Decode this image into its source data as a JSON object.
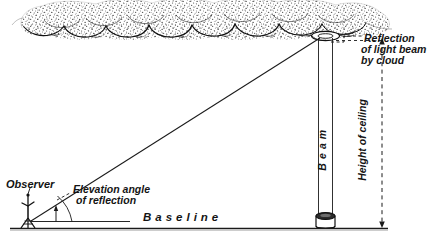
{
  "diagram": {
    "background_color": "#ffffff",
    "ink_color": "#1a1a1a",
    "cloud_fill": "#f2f2f2"
  },
  "labels": {
    "observer": "Observer",
    "elevation_angle_line1": "Elevation angle",
    "elevation_angle_line2": "of reflection",
    "base_line": "B a s e   l i n e",
    "beam": "B e a m",
    "height_of_ceiling": "Height of ceiling",
    "reflection_line1": "Reflection",
    "reflection_line2": "of light beam",
    "reflection_line3": "by cloud"
  },
  "elements": {
    "cloud_name": "cloud-layer",
    "beam_name": "light-beam-column",
    "projector_name": "ceiling-light-projector",
    "observer_figure_name": "observer-figure",
    "sight_line_name": "line-of-sight",
    "base_line_name": "base-line",
    "angle_arc_name": "elevation-angle-arc",
    "height_dashed_name": "height-of-ceiling-dashed-line",
    "reflection_pointer_name": "reflection-pointer-dashed-line"
  },
  "geometry": {
    "base_line_y": 228,
    "observer_x": 28,
    "projector_x": 325,
    "beam_top_y": 40,
    "beam_left_x": 318,
    "beam_right_x": 333,
    "height_line_x": 382,
    "cloud_base_y": 32
  }
}
